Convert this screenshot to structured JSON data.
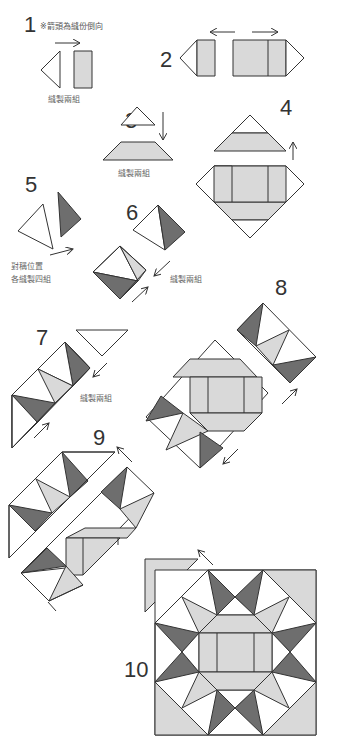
{
  "diagram": {
    "type": "quilt-block-assembly-instructions",
    "colors": {
      "background": "#ffffff",
      "white_fabric": "#ffffff",
      "light_fabric": "#d9d9d9",
      "dark_fabric": "#6e6e6e",
      "outline": "#333333"
    },
    "steps": [
      {
        "number": "1",
        "note": "※箭頭為縫份倒向",
        "caption": "縫製兩組"
      },
      {
        "number": "2",
        "caption": ""
      },
      {
        "number": "3",
        "caption": "縫製兩組"
      },
      {
        "number": "4",
        "caption": ""
      },
      {
        "number": "5",
        "caption_line1": "對稱位置",
        "caption_line2": "各縫製四組"
      },
      {
        "number": "6",
        "caption": "縫製兩組"
      },
      {
        "number": "7",
        "caption": "縫製兩組"
      },
      {
        "number": "8",
        "caption": ""
      },
      {
        "number": "9",
        "caption": ""
      },
      {
        "number": "10",
        "caption": ""
      }
    ]
  }
}
